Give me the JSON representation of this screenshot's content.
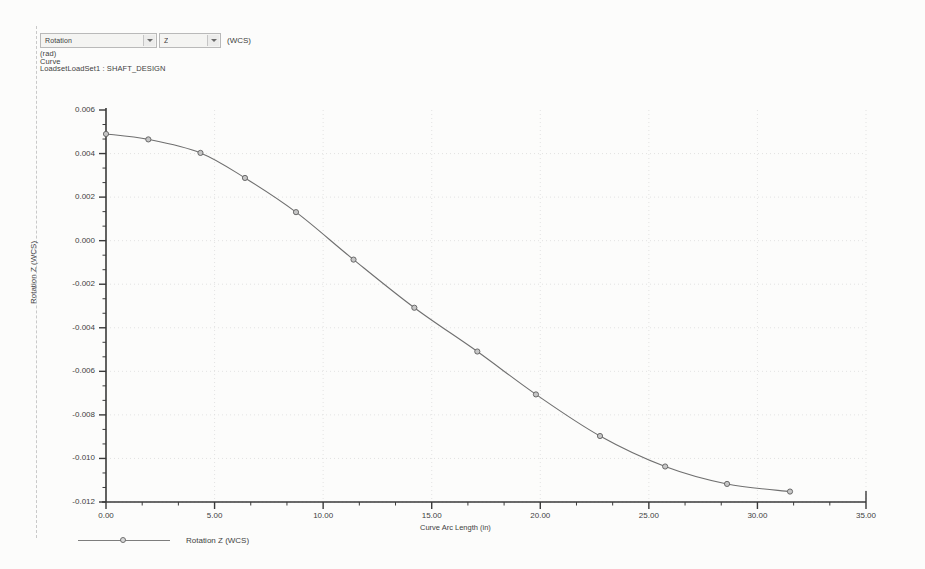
{
  "header": {
    "quantity_select": {
      "value": "Rotation",
      "icon": "chevron-down-icon"
    },
    "component_select": {
      "value": "Z",
      "icon": "chevron-down-icon"
    },
    "coord_system_suffix": "(WCS)",
    "units": "(rad)",
    "entity_type": "Curve",
    "loadset": "LoadsetLoadSet1 :  SHAFT_DESIGN"
  },
  "legend": {
    "entries": [
      {
        "label": "Rotation Z (WCS)",
        "color": "#7d7d7d",
        "marker": "circle"
      }
    ]
  },
  "chart_data": {
    "type": "line",
    "title": "",
    "xlabel": "Curve Arc Length (in)",
    "ylabel": "Rotation Z (WCS)",
    "xlim": [
      0,
      35
    ],
    "ylim": [
      -0.012,
      0.006
    ],
    "xticks": [
      0,
      5,
      10,
      15,
      20,
      25,
      30,
      35
    ],
    "xtick_labels": [
      "0.00",
      "5.00",
      "10.00",
      "15.00",
      "20.00",
      "25.00",
      "30.00",
      "35.00"
    ],
    "yticks": [
      0.006,
      0.004,
      0.002,
      0.0,
      -0.002,
      -0.004,
      -0.006,
      -0.008,
      -0.01,
      -0.012
    ],
    "ytick_labels": [
      "0.006",
      "0.004",
      "0.002",
      "0.000",
      "-0.002",
      "-0.004",
      "-0.006",
      "-0.008",
      "-0.010",
      "-0.012"
    ],
    "minor_ticks_per_interval": 2,
    "grid": true,
    "grid_style": "dotted",
    "legend_position": "below-left",
    "series": [
      {
        "name": "Rotation Z (WCS)",
        "color": "#6f6f6f",
        "marker": "circle",
        "x": [
          0.0,
          1.95,
          4.35,
          6.4,
          8.75,
          11.4,
          14.2,
          17.1,
          19.8,
          22.75,
          25.75,
          28.6,
          31.5
        ],
        "y": [
          0.0049,
          0.00465,
          0.00403,
          0.00288,
          0.00131,
          -0.00087,
          -0.00308,
          -0.00509,
          -0.00706,
          -0.00897,
          -0.01037,
          -0.01117,
          -0.01152
        ]
      }
    ]
  },
  "plot_geometry": {
    "left": 106,
    "right": 866,
    "top": 110,
    "bottom": 502
  },
  "colors": {
    "page_background": "#fcfcfb",
    "axis": "#3a3a3a",
    "grid": "#dcdcdc",
    "text": "#3f3f3f",
    "curve": "#6f6f6f"
  }
}
